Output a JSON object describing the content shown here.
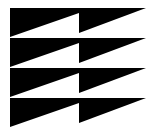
{
  "logo": {
    "name": "stacked-sawtooth-logo",
    "fill_color": "#000000",
    "background_color": "#ffffff",
    "rows": 4,
    "row_tops": [
      8,
      38,
      68,
      98
    ],
    "left_x": 10,
    "notch_x": 79,
    "right_x": 146,
    "left_drop": 29,
    "notch_left_drop": 5,
    "notch_right_drop": 25
  }
}
